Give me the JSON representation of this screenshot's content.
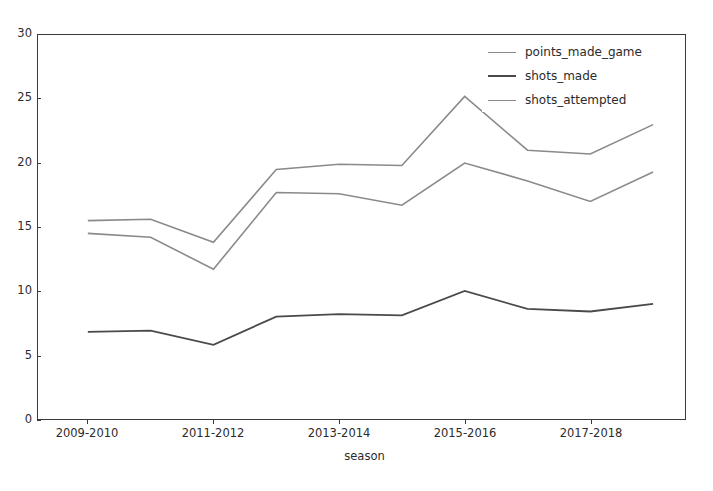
{
  "figure": {
    "background_color": "#ffffff",
    "axes_color": "#3a3a3a",
    "text_color": "#2b2b2b"
  },
  "chart_data": {
    "type": "line",
    "title": "",
    "xlabel": "season",
    "ylabel": "",
    "grid": false,
    "legend_position": "upper right",
    "ylim": [
      0,
      30
    ],
    "yticks": [
      0,
      5,
      10,
      15,
      20,
      25,
      30
    ],
    "ytick_labels": [
      "0",
      "5",
      "10",
      "15",
      "20",
      "25",
      "30"
    ],
    "x": [
      "2009-2010",
      "2010-2011",
      "2011-2012",
      "2012-2013",
      "2013-2014",
      "2014-2015",
      "2015-2016",
      "2016-2017",
      "2017-2018",
      "2018-2019"
    ],
    "xtick_labels": [
      "2009-2010",
      "2011-2012",
      "2013-2014",
      "2015-2016",
      "2017-2018"
    ],
    "xtick_indices": [
      0,
      2,
      4,
      6,
      8
    ],
    "series": [
      {
        "name": "points_made_game",
        "color": "#8a8a8a",
        "linewidth": 1.6,
        "values": [
          14.5,
          14.2,
          11.7,
          17.7,
          17.6,
          16.7,
          20.0,
          18.6,
          17.0,
          19.3
        ]
      },
      {
        "name": "shots_made",
        "color": "#4a4a4a",
        "linewidth": 1.8,
        "values": [
          6.8,
          6.9,
          5.8,
          8.0,
          8.2,
          8.1,
          10.0,
          8.6,
          8.4,
          9.0
        ]
      },
      {
        "name": "shots_attempted",
        "color": "#8a8a8a",
        "linewidth": 1.6,
        "values": [
          15.5,
          15.6,
          13.8,
          19.5,
          19.9,
          19.8,
          25.2,
          21.0,
          20.7,
          23.0
        ]
      }
    ]
  },
  "legend": {
    "entries": [
      {
        "label": "points_made_game",
        "color": "#8a8a8a",
        "linewidth": 1.6
      },
      {
        "label": "shots_made",
        "color": "#4a4a4a",
        "linewidth": 2.2
      },
      {
        "label": "shots_attempted",
        "color": "#8a8a8a",
        "linewidth": 1.6
      }
    ]
  }
}
